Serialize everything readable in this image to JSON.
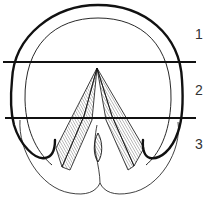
{
  "diagram": {
    "type": "anatomical-line-drawing",
    "colors": {
      "stroke": "#111111",
      "hatch": "#555555",
      "background": "#ffffff"
    },
    "zones": [
      {
        "id": "1",
        "label": "1"
      },
      {
        "id": "2",
        "label": "2"
      },
      {
        "id": "3",
        "label": "3"
      }
    ],
    "divider_lines": [
      {
        "y": 62
      },
      {
        "y": 118
      }
    ]
  }
}
